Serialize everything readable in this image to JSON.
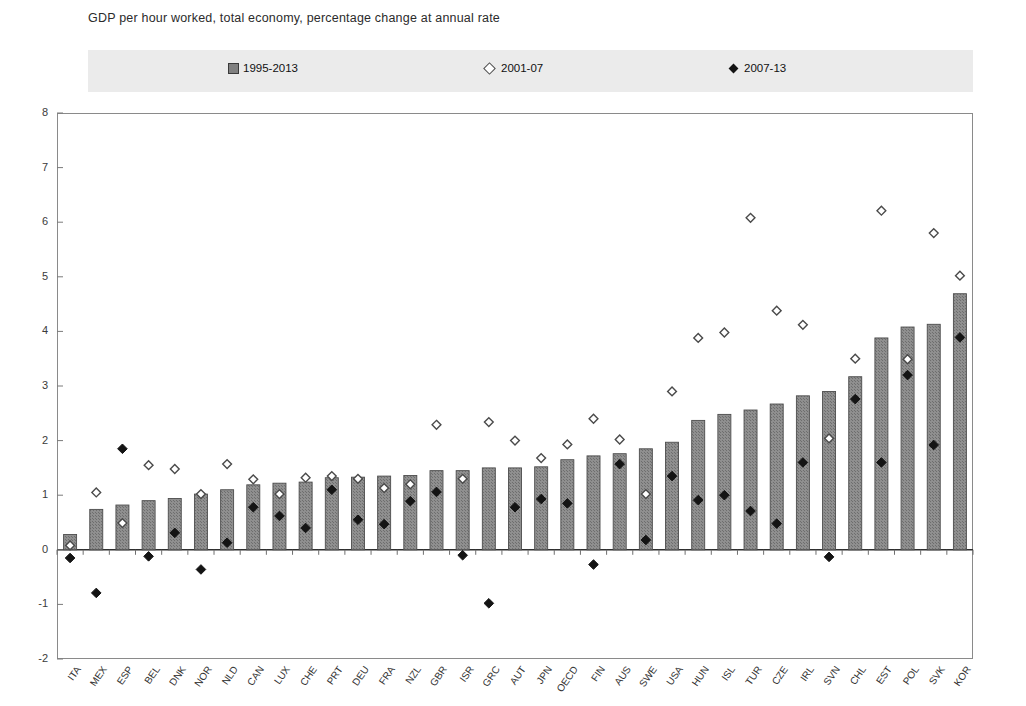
{
  "title": "GDP per hour worked, total economy, percentage change at annual rate",
  "legend": {
    "items": [
      {
        "label": "1995-2013",
        "marker": "bar-swatch-icon",
        "color": "#808080"
      },
      {
        "label": "2001-07",
        "marker": "open-diamond-icon",
        "color": "#ffffff"
      },
      {
        "label": "2007-13",
        "marker": "filled-diamond-icon",
        "color": "#141414"
      }
    ]
  },
  "chart_data": {
    "type": "bar",
    "title": "GDP per hour worked, total economy, percentage change at annual rate",
    "xlabel": "",
    "ylabel": "",
    "ylim": [
      -2,
      8
    ],
    "yticks": [
      -2,
      -1,
      0,
      1,
      2,
      3,
      4,
      5,
      6,
      7,
      8
    ],
    "grid": false,
    "legend_position": "top",
    "categories": [
      "ITA",
      "MEX",
      "ESP",
      "BEL",
      "DNK",
      "NOR",
      "NLD",
      "CAN",
      "LUX",
      "CHE",
      "PRT",
      "DEU",
      "FRA",
      "NZL",
      "GBR",
      "ISR",
      "GRC",
      "AUT",
      "JPN",
      "OECD",
      "FIN",
      "AUS",
      "SWE",
      "USA",
      "HUN",
      "ISL",
      "TUR",
      "CZE",
      "IRL",
      "SVN",
      "CHL",
      "EST",
      "POL",
      "SVK",
      "KOR"
    ],
    "series": [
      {
        "name": "1995-2013",
        "type": "bar",
        "color": "#808080",
        "values": [
          0.28,
          0.74,
          0.82,
          0.9,
          0.94,
          1.02,
          1.1,
          1.19,
          1.22,
          1.24,
          1.32,
          1.33,
          1.35,
          1.36,
          1.45,
          1.45,
          1.5,
          1.5,
          1.52,
          1.65,
          1.72,
          1.76,
          1.85,
          1.97,
          2.37,
          2.48,
          2.56,
          2.67,
          2.82,
          2.9,
          3.17,
          3.88,
          4.08,
          4.13,
          4.69
        ]
      },
      {
        "name": "2001-07",
        "type": "scatter",
        "marker": "open-diamond",
        "color": "#ffffff",
        "values": [
          0.08,
          1.05,
          0.49,
          1.55,
          1.48,
          1.02,
          1.57,
          1.29,
          1.02,
          1.32,
          1.35,
          1.3,
          1.13,
          1.2,
          2.29,
          1.3,
          2.34,
          2.0,
          1.68,
          1.93,
          2.4,
          2.02,
          1.02,
          2.9,
          3.88,
          3.98,
          6.08,
          4.38,
          4.12,
          2.04,
          3.5,
          6.21,
          3.49,
          5.8,
          5.02
        ]
      },
      {
        "name": "2007-13",
        "type": "scatter",
        "marker": "filled-diamond",
        "color": "#141414",
        "values": [
          -0.15,
          -0.79,
          1.85,
          -0.12,
          0.31,
          -0.36,
          0.13,
          0.78,
          0.62,
          0.4,
          1.1,
          0.55,
          0.47,
          0.89,
          1.06,
          -0.1,
          -0.98,
          0.78,
          0.93,
          0.85,
          -0.27,
          1.57,
          0.18,
          1.35,
          0.91,
          1.0,
          0.71,
          0.48,
          1.6,
          -0.13,
          2.76,
          1.6,
          3.2,
          1.92,
          3.89
        ]
      }
    ]
  },
  "axes": {
    "y_tick_labels": [
      "8",
      "7",
      "6",
      "5",
      "4",
      "3",
      "2",
      "1",
      "0",
      "-1",
      "-2"
    ],
    "x_tick_labels": [
      "ITA",
      "MEX",
      "ESP",
      "BEL",
      "DNK",
      "NOR",
      "NLD",
      "CAN",
      "LUX",
      "CHE",
      "PRT",
      "DEU",
      "FRA",
      "NZL",
      "GBR",
      "ISR",
      "GRC",
      "AUT",
      "JPN",
      "OECD",
      "FIN",
      "AUS",
      "SWE",
      "USA",
      "HUN",
      "ISL",
      "TUR",
      "CZE",
      "IRL",
      "SVN",
      "CHL",
      "EST",
      "POL",
      "SVK",
      "KOR"
    ]
  }
}
